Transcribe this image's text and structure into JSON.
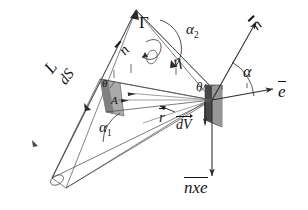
{
  "figure": {
    "background_color": "#ffffff",
    "line_color": "#3a3a3a",
    "text_color": "#151515",
    "shade_fill_dark": "#7d7d7d",
    "shade_fill_mid": "#9a9a9a",
    "shade_fill_light": "#c2c2c2"
  },
  "labels": {
    "gamma": {
      "text": "Γ",
      "x": 139,
      "y": 22,
      "size": 17,
      "rotation": 0,
      "italic": false,
      "name": "gamma-label"
    },
    "alpha2": {
      "text": "α",
      "sub": "2",
      "x": 186,
      "y": 30,
      "size": 15,
      "rotation": 0,
      "italic": true,
      "name": "alpha2-label"
    },
    "alpha": {
      "text": "α",
      "sub": "",
      "x": 243,
      "y": 72,
      "size": 15,
      "rotation": 0,
      "italic": true,
      "name": "alpha-label"
    },
    "alpha1": {
      "text": "α",
      "sub": "1",
      "x": 99,
      "y": 128,
      "size": 15,
      "rotation": 0,
      "italic": true,
      "name": "alpha1-label"
    },
    "theta_center": {
      "text": "θ",
      "x": 196,
      "y": 87,
      "size": 13,
      "rotation": 0,
      "italic": true,
      "name": "theta-center-label"
    },
    "theta_inner": {
      "text": "θ",
      "x": 102,
      "y": 85,
      "size": 11,
      "rotation": 0,
      "italic": true,
      "name": "theta-inner-label"
    },
    "eta_curve": {
      "text": "η",
      "x": 171,
      "y": 63,
      "size": 15,
      "rotation": -18,
      "italic": true,
      "name": "eta-label"
    },
    "n_vector_top": {
      "text": "n",
      "x": 253,
      "y": 26,
      "size": 15,
      "rotation": -44,
      "italic": true,
      "name": "n-vector-top-label"
    },
    "n_vector_beam": {
      "text": "n",
      "x": 118,
      "y": 53,
      "size": 15,
      "rotation": -48,
      "italic": true,
      "name": "n-vector-beam-label"
    },
    "e_vector": {
      "text": "e",
      "x": 281,
      "y": 91,
      "size": 16,
      "rotation": 0,
      "italic": true,
      "name": "e-vector-label"
    },
    "L_label": {
      "text": "L",
      "x": 43,
      "y": 72,
      "size": 16,
      "rotation": -52,
      "italic": true,
      "name": "L-label"
    },
    "dS_label": {
      "text": "dS",
      "x": 58,
      "y": 82,
      "size": 15,
      "rotation": -52,
      "italic": true,
      "name": "dS-label"
    },
    "A_label": {
      "text": "A",
      "x": 111,
      "y": 101,
      "size": 11,
      "rotation": 0,
      "italic": true,
      "name": "A-label"
    },
    "r_vector": {
      "text": "r",
      "x": 160,
      "y": 116,
      "size": 15,
      "rotation": 0,
      "italic": true,
      "name": "r-vector-label"
    },
    "dV_label": {
      "text": "dV",
      "x": 177,
      "y": 125,
      "size": 14,
      "rotation": 0,
      "italic": true,
      "name": "dV-label"
    },
    "nxe_label": {
      "text": "nxe",
      "x": 186,
      "y": 187,
      "size": 16,
      "rotation": 0,
      "italic": true,
      "name": "n-cross-e-label"
    }
  },
  "geometry": {
    "vertex_main": {
      "x": 212,
      "y": 100
    },
    "vertex_left": {
      "x": 52,
      "y": 178
    },
    "beam_apex": {
      "x": 136,
      "y": 10
    },
    "e_axis_end": {
      "x": 271,
      "y": 89
    },
    "n_axis_end": {
      "x": 253,
      "y": 23
    },
    "nxe_axis_end": {
      "x": 212,
      "y": 175
    }
  },
  "vectors": [
    {
      "name": "e-vector-arrow",
      "label": "e",
      "direction": "right"
    },
    {
      "name": "n-vector-arrow",
      "label": "n",
      "direction": "upper-right"
    },
    {
      "name": "nxe-vector-arrow",
      "label": "nxe",
      "direction": "down"
    },
    {
      "name": "r-vector-arrow",
      "label": "r",
      "direction": "lower-left"
    },
    {
      "name": "dV-vector-arrow",
      "label": "dV",
      "direction": "down"
    }
  ],
  "angles": [
    {
      "name": "alpha",
      "symbol": "α"
    },
    {
      "name": "alpha1",
      "symbol": "α1"
    },
    {
      "name": "alpha2",
      "symbol": "α2"
    },
    {
      "name": "theta",
      "symbol": "θ"
    },
    {
      "name": "eta",
      "symbol": "η"
    },
    {
      "name": "gamma",
      "symbol": "Γ"
    }
  ]
}
